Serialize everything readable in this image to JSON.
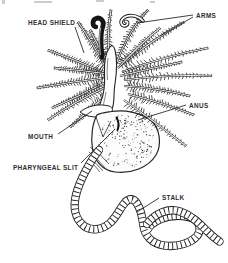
{
  "figure": {
    "name": "pterobranch-anatomy-diagram",
    "style": "black ink line drawing on white"
  },
  "colors": {
    "ink": "#1b1b1b",
    "paper": "#ffffff",
    "label_text": "#2f2f2f",
    "leader": "#2b2b2b"
  },
  "labels": [
    {
      "id": "head-shield",
      "text": "HEAD SHIELD",
      "x": 28,
      "y": 25,
      "leaders": [
        [
          75,
          27,
          84,
          53
        ]
      ]
    },
    {
      "id": "arms",
      "text": "ARMS",
      "x": 196,
      "y": 18,
      "leaders": [
        [
          193,
          15,
          137,
          23
        ],
        [
          193,
          17,
          160,
          36
        ]
      ]
    },
    {
      "id": "anus",
      "text": "ANUS",
      "x": 189,
      "y": 108,
      "leaders": [
        [
          186,
          105,
          138,
          120
        ]
      ]
    },
    {
      "id": "mouth",
      "text": "MOUTH",
      "x": 28,
      "y": 139,
      "leaders": [
        [
          58,
          134,
          92,
          111
        ]
      ]
    },
    {
      "id": "pharyngeal-slit",
      "text": "PHARYNGEAL SLIT",
      "x": 13,
      "y": 170,
      "leaders": [
        [
          81,
          163,
          115,
          129
        ]
      ]
    },
    {
      "id": "stalk",
      "text": "STALK",
      "x": 162,
      "y": 200,
      "leaders": [
        [
          159,
          198,
          137,
          212
        ]
      ]
    }
  ]
}
